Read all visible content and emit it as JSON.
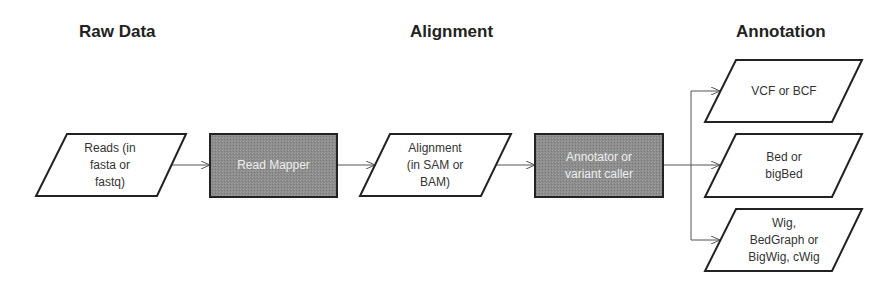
{
  "headings": {
    "raw_data": "Raw Data",
    "alignment": "Alignment",
    "annotation": "Annotation"
  },
  "nodes": {
    "reads": {
      "line1": "Reads (in",
      "line2": "fasta or",
      "line3": "fastq)",
      "shape": "parallelogram"
    },
    "read_mapper": {
      "label": "Read Mapper",
      "shape": "process-box"
    },
    "alignment": {
      "line1": "Alignment",
      "line2": "(in SAM or",
      "line3": "BAM)",
      "shape": "parallelogram"
    },
    "annotator": {
      "line1": "Annotator or",
      "line2": "variant caller",
      "shape": "process-box"
    },
    "vcf": {
      "label": "VCF or BCF",
      "shape": "parallelogram"
    },
    "bed": {
      "line1": "Bed or",
      "line2": "bigBed",
      "shape": "parallelogram"
    },
    "wig": {
      "line1": "Wig,",
      "line2": "BedGraph or",
      "line3": "BigWig, cWig",
      "shape": "parallelogram"
    }
  },
  "edges": [
    {
      "from": "reads",
      "to": "read_mapper"
    },
    {
      "from": "read_mapper",
      "to": "alignment"
    },
    {
      "from": "alignment",
      "to": "annotator"
    },
    {
      "from": "annotator",
      "to": "vcf"
    },
    {
      "from": "annotator",
      "to": "bed"
    },
    {
      "from": "annotator",
      "to": "wig"
    }
  ],
  "colors": {
    "process_fill": "#8c8c8c",
    "stroke": "#222222",
    "arrow": "#555555",
    "process_text": "#eeeeee"
  }
}
